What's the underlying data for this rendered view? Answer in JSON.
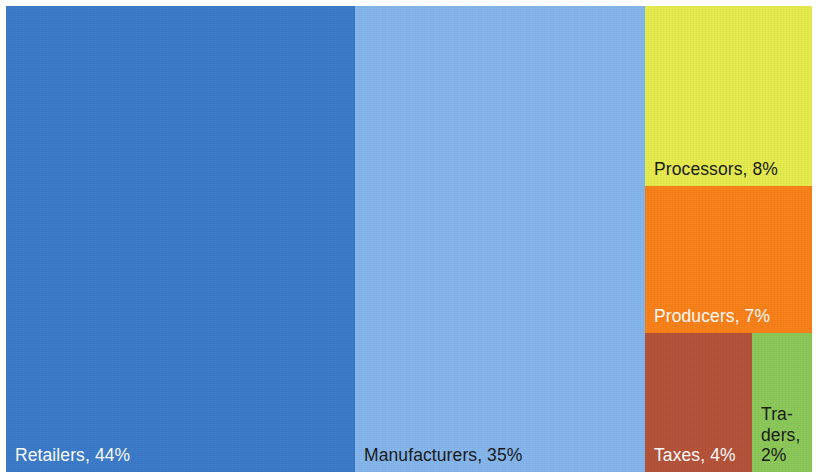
{
  "chart_data": {
    "type": "treemap",
    "title": "",
    "subtitle": "",
    "xlabel": "",
    "ylabel": "",
    "legend_position": "none",
    "grid": false,
    "value_unit": "%",
    "categories": [
      "Retailers",
      "Manufacturers",
      "Processors",
      "Producers",
      "Taxes",
      "Traders"
    ],
    "values": [
      44,
      35,
      8,
      7,
      4,
      2
    ],
    "labels": [
      "Retailers, 44%",
      "Manufacturers, 35%",
      "Processors, 8%",
      "Producers, 7%",
      "Taxes, 4%",
      "Tra-\nders,\n2%"
    ],
    "colors": [
      "#3c7cca",
      "#85b6ec",
      "#e6ec4d",
      "#f9821a",
      "#b5543a",
      "#8cc95a"
    ]
  },
  "tiles": [
    {
      "name": "retailers",
      "label": "Retailers, 44%",
      "value": 44,
      "color": "#3c7cca",
      "text_color": "light",
      "x": 0,
      "y": 0,
      "w": 349,
      "h": 466
    },
    {
      "name": "manufacturers",
      "label": "Manufacturers, 35%",
      "value": 35,
      "color": "#85b6ec",
      "text_color": "dark",
      "x": 349,
      "y": 0,
      "w": 290,
      "h": 466
    },
    {
      "name": "processors",
      "label": "Processors, 8%",
      "value": 8,
      "color": "#e6ec4d",
      "text_color": "dark",
      "x": 639,
      "y": 0,
      "w": 167,
      "h": 180
    },
    {
      "name": "producers",
      "label": "Producers, 7%",
      "value": 7,
      "color": "#f9821a",
      "text_color": "light",
      "x": 639,
      "y": 180,
      "w": 167,
      "h": 147
    },
    {
      "name": "taxes",
      "label": "Taxes, 4%",
      "value": 4,
      "color": "#b5543a",
      "text_color": "light",
      "x": 639,
      "y": 327,
      "w": 107,
      "h": 139
    },
    {
      "name": "traders",
      "label": "Tra-\nders,\n2%",
      "value": 2,
      "color": "#8cc95a",
      "text_color": "dark",
      "x": 746,
      "y": 327,
      "w": 60,
      "h": 139
    }
  ]
}
